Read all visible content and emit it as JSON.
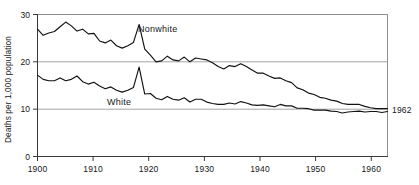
{
  "chart_data": {
    "type": "line",
    "title": "",
    "subtitle": "",
    "xlabel": "",
    "ylabel": "Deaths per 1,000 population",
    "xlim": [
      1900,
      1962
    ],
    "ylim": [
      0,
      30
    ],
    "grid": true,
    "gridlines_y": [
      10,
      20,
      30
    ],
    "legend_position": "inline-annotation",
    "x_ticks": [
      1900,
      1910,
      1920,
      1930,
      1940,
      1950,
      1960
    ],
    "x_tick_labels": [
      "1900",
      "1910",
      "1920",
      "1930",
      "1940",
      "1950",
      "1960"
    ],
    "y_ticks": [
      0,
      10,
      20,
      30
    ],
    "y_tick_labels": [
      "0",
      "10",
      "20",
      "30"
    ],
    "end_annotation": "1962",
    "x": [
      1900,
      1901,
      1902,
      1903,
      1904,
      1905,
      1906,
      1907,
      1908,
      1909,
      1910,
      1911,
      1912,
      1913,
      1914,
      1915,
      1916,
      1917,
      1918,
      1919,
      1920,
      1921,
      1922,
      1923,
      1924,
      1925,
      1926,
      1927,
      1928,
      1929,
      1930,
      1931,
      1932,
      1933,
      1934,
      1935,
      1936,
      1937,
      1938,
      1939,
      1940,
      1941,
      1942,
      1943,
      1944,
      1945,
      1946,
      1947,
      1948,
      1949,
      1950,
      1951,
      1952,
      1953,
      1954,
      1955,
      1956,
      1957,
      1958,
      1959,
      1960,
      1961,
      1962
    ],
    "series": [
      {
        "name": "Nonwhite",
        "label": "Nonwhite",
        "color": "#111111",
        "values": [
          26.9,
          25.6,
          26.1,
          26.4,
          27.4,
          28.4,
          27.6,
          26.5,
          26.9,
          25.9,
          26.0,
          24.4,
          24.0,
          24.6,
          23.4,
          22.9,
          23.4,
          24.1,
          27.9,
          22.7,
          21.4,
          20.0,
          20.2,
          21.2,
          20.4,
          20.2,
          21.0,
          20.0,
          20.8,
          20.6,
          20.4,
          19.8,
          19.0,
          18.5,
          19.2,
          19.0,
          19.6,
          19.0,
          18.3,
          17.6,
          17.6,
          17.0,
          16.5,
          16.6,
          16.0,
          15.6,
          14.5,
          14.1,
          13.4,
          13.1,
          12.5,
          12.3,
          11.9,
          11.7,
          11.2,
          11.0,
          11.0,
          11.0,
          10.6,
          10.3,
          10.1,
          10.1,
          10.1
        ]
      },
      {
        "name": "White",
        "label": "White",
        "color": "#111111",
        "values": [
          17.2,
          16.3,
          16.0,
          16.0,
          16.6,
          16.0,
          16.3,
          17.0,
          15.8,
          15.3,
          15.7,
          14.9,
          14.3,
          14.7,
          14.0,
          13.6,
          14.0,
          14.6,
          18.9,
          13.2,
          13.3,
          12.3,
          12.0,
          12.7,
          12.1,
          11.9,
          12.4,
          11.5,
          12.1,
          12.1,
          11.5,
          11.2,
          11.0,
          11.0,
          11.3,
          11.1,
          11.6,
          11.3,
          10.9,
          10.8,
          10.9,
          10.7,
          10.5,
          11.0,
          10.7,
          10.7,
          10.2,
          10.2,
          10.1,
          9.8,
          9.8,
          9.8,
          9.6,
          9.5,
          9.2,
          9.4,
          9.5,
          9.6,
          9.4,
          9.5,
          9.5,
          9.3,
          9.5
        ]
      }
    ]
  },
  "annotations": {
    "nonwhite_label": "Nonwhite",
    "white_label": "White",
    "right_year": "1962"
  }
}
